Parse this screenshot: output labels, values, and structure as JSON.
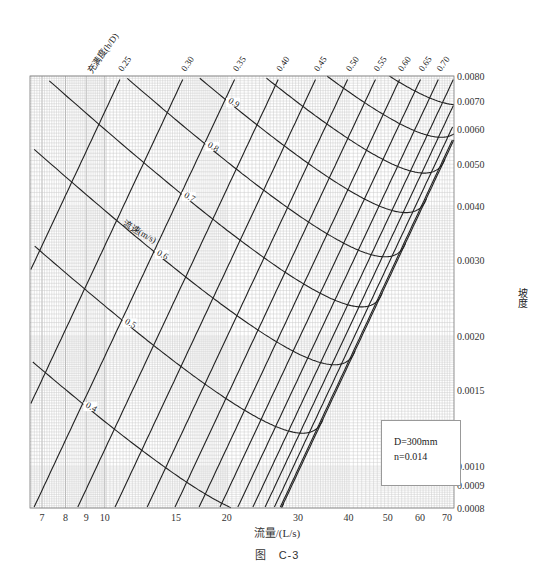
{
  "chart_data": {
    "type": "line",
    "subtitle": "D=300mm, n=0.014",
    "xlabel": "流量/(L/s)",
    "ylabel": "坡度",
    "xscale": "log",
    "yscale": "log",
    "xlim": [
      6.5,
      72
    ],
    "ylim": [
      0.0008,
      0.008
    ],
    "x_ticks": [
      7,
      8,
      9,
      10,
      15,
      20,
      30,
      40,
      50,
      60,
      70
    ],
    "y_ticks": [
      0.008,
      0.007,
      0.006,
      0.005,
      0.004,
      0.003,
      0.002,
      0.0015,
      0.001,
      0.0009,
      0.0008
    ],
    "grid": true,
    "pipe": {
      "diameter_mm": 300,
      "roughness_n": 0.014
    },
    "fill_ratio_label": "充满度(h/D)",
    "fill_ratio_lines": [
      0.25,
      0.3,
      0.35,
      0.4,
      0.45,
      0.5,
      0.55,
      0.6,
      0.65,
      0.7,
      0.75,
      0.8,
      0.85,
      0.9,
      0.95
    ],
    "velocity_label": "流速(m/s)",
    "velocity_lines": [
      0.4,
      0.5,
      0.6,
      0.7,
      0.8,
      0.9,
      1.0,
      1.1,
      1.2
    ],
    "velocity_labels_shown": [
      "0.4",
      "0.5",
      "0.6",
      "0.7",
      "0.8",
      "0.9",
      "1.0",
      "1.1",
      "1.2"
    ]
  },
  "axes": {
    "x_ticks": [
      "7",
      "8",
      "9",
      "10",
      "15",
      "20",
      "30",
      "40",
      "50",
      "60",
      "70"
    ],
    "y_ticks": [
      "0.0080",
      "0.0070",
      "0.0060",
      "0.0050",
      "0.0040",
      "0.0030",
      "0.0020",
      "0.0015",
      "0.0010",
      "0.0009",
      "0.0008"
    ],
    "x_label": "流量/(L/s)",
    "y_label": "坡度"
  },
  "legend": {
    "diameter": "D=300mm",
    "roughness": "n=0.014"
  },
  "caption": "图　C-3"
}
